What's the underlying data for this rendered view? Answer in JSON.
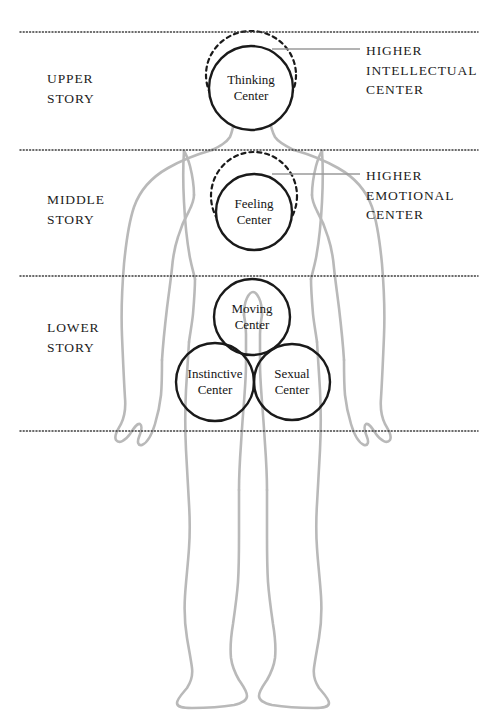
{
  "diagram": {
    "colors": {
      "body_outline": "#b9b9b9",
      "circle_stroke": "#1a1a1a",
      "dotted_line": "#3a3a3a",
      "leader_line": "#9a9a9a",
      "text": "#1c1c1c",
      "background": "#ffffff"
    },
    "story_labels": [
      {
        "id": "upper",
        "text": "UPPER\nSTORY",
        "x": 47,
        "y": 69
      },
      {
        "id": "middle",
        "text": "MIDDLE\nSTORY",
        "x": 47,
        "y": 190
      },
      {
        "id": "lower",
        "text": "LOWER\nSTORY",
        "x": 47,
        "y": 318
      }
    ],
    "centers": [
      {
        "id": "thinking",
        "text": "Thinking\nCenter",
        "cx": 251,
        "cy": 88,
        "r": 42
      },
      {
        "id": "feeling",
        "text": "Feeling\nCenter",
        "cx": 254,
        "cy": 212,
        "r": 38
      },
      {
        "id": "moving",
        "text": "Moving\nCenter",
        "cx": 252,
        "cy": 317,
        "r": 38
      },
      {
        "id": "instinctive",
        "text": "Instinctive\nCenter",
        "cx": 215,
        "cy": 382,
        "r": 39
      },
      {
        "id": "sexual",
        "text": "Sexual\nCenter",
        "cx": 292,
        "cy": 382,
        "r": 38
      }
    ],
    "higher_centers": [
      {
        "id": "higher-intellectual",
        "text": "HIGHER\nINTELLECTUAL\nCENTER",
        "x": 366,
        "y": 41
      },
      {
        "id": "higher-emotional",
        "text": "HIGHER\nEMOTIONAL\nCENTER",
        "x": 366,
        "y": 166
      }
    ],
    "dotted_lines": [
      {
        "id": "line-top",
        "y": 32,
        "x1": 20,
        "x2": 478
      },
      {
        "id": "line-upper-middle",
        "y": 150,
        "x1": 20,
        "x2": 478
      },
      {
        "id": "line-middle-lower",
        "y": 276,
        "x1": 20,
        "x2": 478
      },
      {
        "id": "line-bottom",
        "y": 431,
        "x1": 20,
        "x2": 478
      }
    ],
    "leader_lines": [
      {
        "id": "leader-intellectual",
        "x1": 272,
        "y1": 49,
        "x2": 360,
        "y2": 49
      },
      {
        "id": "leader-emotional",
        "x1": 272,
        "y1": 174,
        "x2": 360,
        "y2": 174
      }
    ],
    "dashed_circles": [
      {
        "id": "head-outline",
        "cx": 251,
        "cy": 75,
        "rx": 45,
        "ry": 44
      },
      {
        "id": "chest-outline",
        "cx": 254,
        "cy": 196,
        "rx": 43,
        "ry": 44
      }
    ]
  }
}
